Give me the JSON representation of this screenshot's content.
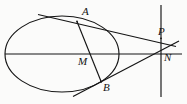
{
  "figure": {
    "type": "geometry-diagram",
    "background_color": "#fbfbfa",
    "stroke_color": "#141414",
    "label_color": "#131313",
    "width": 187,
    "height": 104,
    "labels": {
      "A": "A",
      "B": "B",
      "M": "M",
      "P": "P",
      "N": "N"
    },
    "points": {
      "A": {
        "x": 77,
        "y": 22
      },
      "B": {
        "x": 100,
        "y": 81
      },
      "M": {
        "x": 88,
        "y": 54
      },
      "P": {
        "x": 161,
        "y": 38
      },
      "N": {
        "x": 161,
        "y": 54
      }
    },
    "ellipse": {
      "center_x": 62,
      "center_y": 54,
      "radius_x": 57,
      "radius_y": 38
    },
    "lines": {
      "major_axis": {
        "x1": 5,
        "y1": 54,
        "x2": 182,
        "y2": 54
      },
      "directrix": {
        "x1": 161,
        "y1": 5,
        "x2": 161,
        "y2": 97
      },
      "chord_AB": {
        "x1": 77,
        "y1": 22,
        "x2": 101,
        "y2": 82
      },
      "tangent_at_A": {
        "x1": 38,
        "y1": 14,
        "x2": 174,
        "y2": 46
      },
      "line_BP": {
        "x1": 74,
        "y1": 96,
        "x2": 178,
        "y2": 42
      }
    }
  }
}
